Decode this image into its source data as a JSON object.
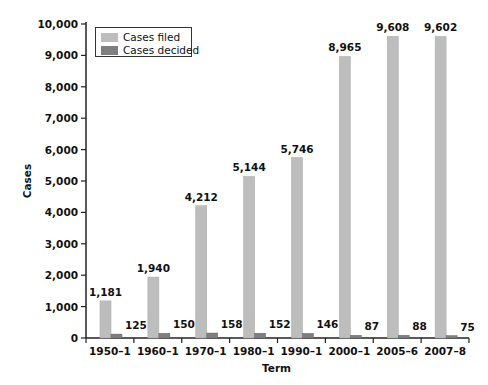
{
  "chart_data": {
    "type": "bar",
    "title": "",
    "xlabel": "Term",
    "ylabel": "Cases",
    "ylim": [
      0,
      10000
    ],
    "yticks": [
      0,
      1000,
      2000,
      3000,
      4000,
      5000,
      6000,
      7000,
      8000,
      9000,
      10000
    ],
    "ytick_labels": [
      "0",
      "1,000",
      "2,000",
      "3,000",
      "4,000",
      "5,000",
      "6,000",
      "7,000",
      "8,000",
      "9,000",
      "10,000"
    ],
    "categories": [
      "1950–1",
      "1960–1",
      "1970–1",
      "1980–1",
      "1990–1",
      "2000–1",
      "2005–6",
      "2007–8"
    ],
    "series": [
      {
        "name": "Cases filed",
        "color": "#bdbdbd",
        "values": [
          1181,
          1940,
          4212,
          5144,
          5746,
          8965,
          9608,
          9602
        ],
        "labels": [
          "1,181",
          "1,940",
          "4,212",
          "5,144",
          "5,746",
          "8,965",
          "9,608",
          "9,602"
        ]
      },
      {
        "name": "Cases decided",
        "color": "#7f7f7f",
        "values": [
          125,
          150,
          158,
          152,
          146,
          87,
          88,
          75
        ],
        "labels": [
          "125",
          "150",
          "158",
          "152",
          "146",
          "87",
          "88",
          "75"
        ]
      }
    ],
    "grid": false,
    "legend_position": "top-left"
  },
  "legend": {
    "filed_label": "Cases filed",
    "decided_label": "Cases decided",
    "filed_color": "#bdbdbd",
    "decided_color": "#7f7f7f"
  },
  "axes": {
    "xlabel": "Term",
    "ylabel": "Cases"
  }
}
